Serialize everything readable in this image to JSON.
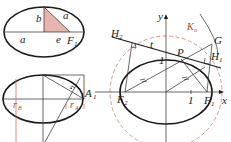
{
  "figure1": {
    "labels": {
      "b": "b",
      "a_top": "a",
      "a_bottom": "a",
      "e": "e",
      "F": "F",
      "F_sub": "1"
    },
    "triangle_fill": "#e8b4ae"
  },
  "figure2": {
    "labels": {
      "rB": "r",
      "rB_sub": "B",
      "rA": "r",
      "rA_sub": "A",
      "A": "A",
      "A_sub": "1"
    },
    "accent": "#c0392b"
  },
  "figure3": {
    "labels": {
      "y": "y",
      "x": "x",
      "K": "K",
      "K_sub": "o",
      "G": "G",
      "H2": "H",
      "H2_sub": "2",
      "H1": "H",
      "H1_sub": "1",
      "t": "t",
      "P": "P",
      "F2": "F",
      "F2_sub": "2",
      "F1": "F",
      "F1_sub": "1",
      "one_y": "1",
      "one_x": "1"
    },
    "circle_color": "#d08a80"
  }
}
